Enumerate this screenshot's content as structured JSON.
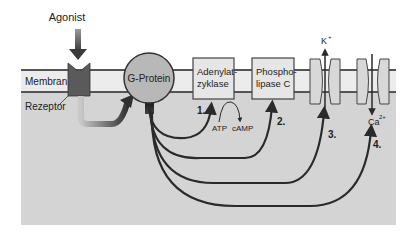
{
  "diagram": {
    "type": "signal-transduction",
    "labels": {
      "agonist": "Agonist",
      "membrane": "Membran",
      "receptor": "Rezeptor",
      "g_protein": "G-Protein",
      "adenylate_line1": "Adenylat-",
      "adenylate_line2": "zyklase",
      "phospho_line1": "Phospho-",
      "phospho_line2": "lipase C",
      "atp": "ATP",
      "camp": "cAMP",
      "potassium": "K",
      "potassium_sup": "+",
      "calcium": "Ca",
      "calcium_sup": "2+"
    },
    "pathway_numbers": [
      "1.",
      "2.",
      "3.",
      "4."
    ],
    "colors": {
      "cytoplasm": "#d4d4d4",
      "membrane_band": "#ececec",
      "membrane_line": "#555555",
      "receptor": "#5a5a5a",
      "g_protein": "#b8b8b8",
      "enzyme_box": "#e6e6e6",
      "arrow": "#2a2a2a"
    }
  }
}
